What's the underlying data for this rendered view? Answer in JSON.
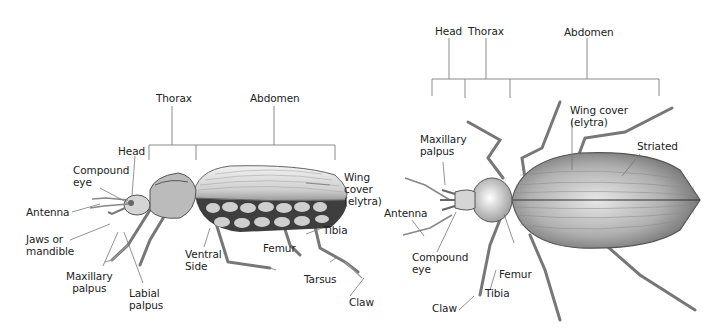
{
  "side_view": {
    "brackets": {
      "thorax": "Thorax",
      "abdomen": "Abdomen"
    },
    "labels": {
      "head": "Head",
      "compound_eye_1": "Compound",
      "compound_eye_2": "eye",
      "antenna": "Antenna",
      "jaws_1": "Jaws or",
      "jaws_2": "mandible",
      "maxillary_1": "Maxillary",
      "maxillary_2": "palpus",
      "labial_1": "Labial",
      "labial_2": "palpus",
      "ventral_1": "Ventral",
      "ventral_2": "Side",
      "femur": "Femur",
      "tibia": "Tibia",
      "tarsus": "Tarsus",
      "claw": "Claw",
      "wing_1": "Wing",
      "wing_2": "cover",
      "wing_3": "(elytra)"
    }
  },
  "top_view": {
    "brackets": {
      "head": "Head",
      "thorax": "Thorax",
      "abdomen": "Abdomen"
    },
    "labels": {
      "maxillary_1": "Maxillary",
      "maxillary_2": "palpus",
      "antenna": "Antenna",
      "compound_eye_1": "Compound",
      "compound_eye_2": "eye",
      "femur": "Femur",
      "tibia": "Tibia",
      "claw": "Claw",
      "wing_1": "Wing cover",
      "wing_2": "(elytra)",
      "striated": "Striated"
    }
  },
  "colors": {
    "line": "#8a8a8a",
    "body_dark": "#4a4a4a",
    "body_light": "#d9d9d9"
  }
}
